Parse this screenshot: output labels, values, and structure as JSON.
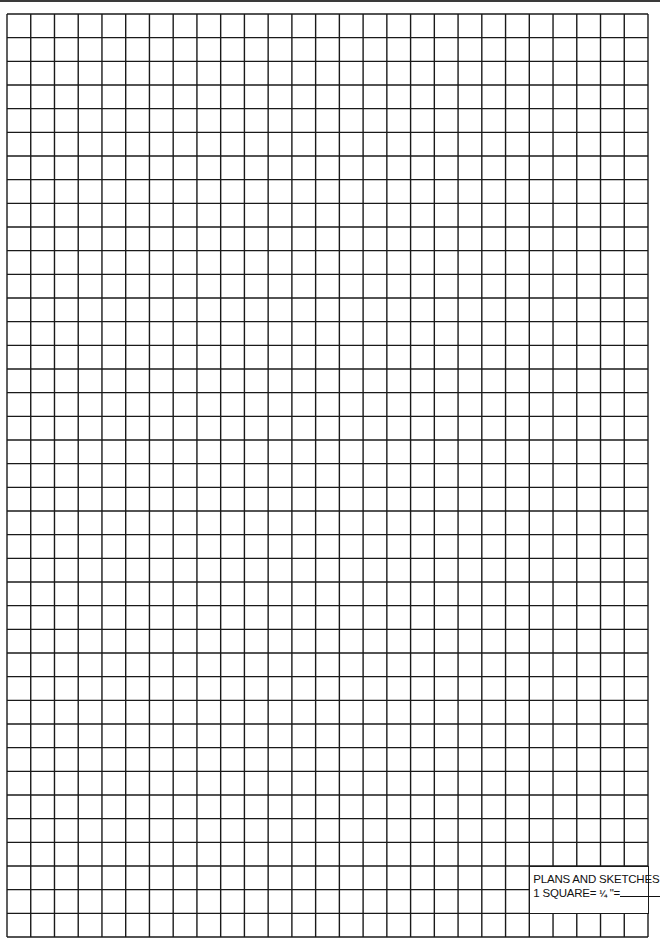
{
  "sheet": {
    "type": "graph-paper",
    "columns": 27,
    "rows": 39,
    "left": 7,
    "top": 14,
    "width": 641,
    "height": 923,
    "line_color": "#1a1a1a",
    "background": "#ffffff"
  },
  "label": {
    "title": "PLANS AND SKETCHES",
    "scale_prefix": "1 SQUARE=",
    "scale_fraction": "¼",
    "scale_unit": "\"=",
    "scale_value": "",
    "col_start": 22,
    "col_span": 5,
    "row_start": 36,
    "row_span": 2
  }
}
